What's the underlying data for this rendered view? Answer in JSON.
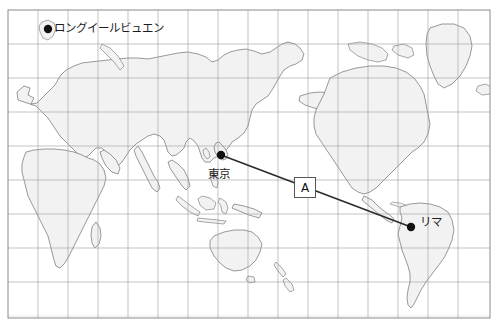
{
  "figure": {
    "kind": "world-map-outline",
    "width": 499,
    "height": 335,
    "background_color": "#ffffff",
    "border_color": "#8a8a8a",
    "graticule_color": "#9a9a9a",
    "coastline_color": "#6e6e6e",
    "land_fill_color": "#f2f2f2",
    "marker_color": "#111111",
    "route_color": "#2b2b2b",
    "label_color": "#1c1c1c"
  },
  "cities": [
    {
      "id": "longyearbyen",
      "label": "ロングイールビュエン",
      "marker_x": 48,
      "marker_y": 29,
      "label_x": 54,
      "label_y": 19
    },
    {
      "id": "tokyo",
      "label": "東京",
      "marker_x": 221,
      "marker_y": 155,
      "label_x": 208,
      "label_y": 165
    },
    {
      "id": "lima",
      "label": "リマ",
      "marker_x": 411,
      "marker_y": 227,
      "label_x": 420,
      "label_y": 213
    }
  ],
  "route": {
    "label": "A",
    "from": "tokyo",
    "to": "lima",
    "start_x": 221,
    "start_y": 155,
    "end_x": 411,
    "end_y": 227,
    "label_box_x": 294,
    "label_box_y": 177,
    "label_box_width": 22,
    "label_box_height": 21
  },
  "graticule": {
    "left": 8,
    "top": 10,
    "right": 490,
    "bottom": 318,
    "vertical_lines": [
      8,
      38,
      68,
      98,
      128,
      158,
      188,
      218,
      248,
      278,
      308,
      338,
      368,
      398,
      428,
      458,
      490
    ],
    "horizontal_lines": [
      10,
      44,
      78,
      112,
      146,
      180,
      214,
      248,
      282,
      318
    ]
  }
}
